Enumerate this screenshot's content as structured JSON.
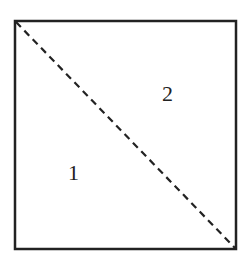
{
  "diagram": {
    "shape": "square",
    "divider": "dashed diagonal from top-left to bottom-right",
    "regions": [
      {
        "label": "1",
        "position": "lower-left triangle"
      },
      {
        "label": "2",
        "position": "upper-right triangle"
      }
    ],
    "colors": {
      "stroke": "#222222",
      "background": "#ffffff"
    }
  }
}
